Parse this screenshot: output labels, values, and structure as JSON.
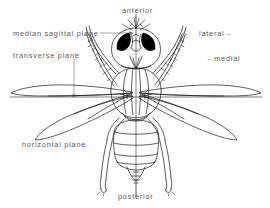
{
  "figure": {
    "kind": "anatomical-line-drawing",
    "background_color": "#ffffff",
    "ink_color": "#1a1a1a",
    "label_color": "#5a5a5a",
    "eye_color": "#000000"
  },
  "labels": {
    "anterior": "anterior",
    "median_sagittal_plane": "median sagittal plane",
    "transverse_plane": "transverse plane",
    "lateral": "lateral→",
    "medial": "←medial",
    "horizontal_plane": "horizontal plane",
    "posterior": "posterior"
  }
}
